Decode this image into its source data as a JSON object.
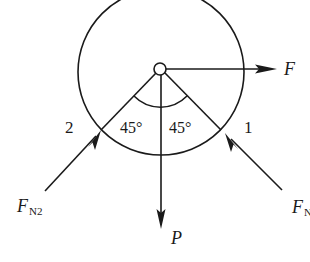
{
  "diagram": {
    "type": "free-body-diagram",
    "colors": {
      "stroke": "#1a1a1a",
      "background": "#ffffff"
    },
    "labels": {
      "force_f": "F",
      "force_p": "P",
      "normal_2_main": "F",
      "normal_2_sub": "N2",
      "normal_1_main": "F",
      "normal_1_sub": "N",
      "support_2": "2",
      "support_1": "1",
      "angle_left": "45°",
      "angle_right": "45°"
    },
    "geometry": {
      "circle_center": [
        161,
        72
      ],
      "circle_radius": 83,
      "pin_center": [
        160,
        69
      ],
      "pin_radius": 6,
      "angle_arc_radius": 37,
      "angle_each_deg": 45
    }
  }
}
